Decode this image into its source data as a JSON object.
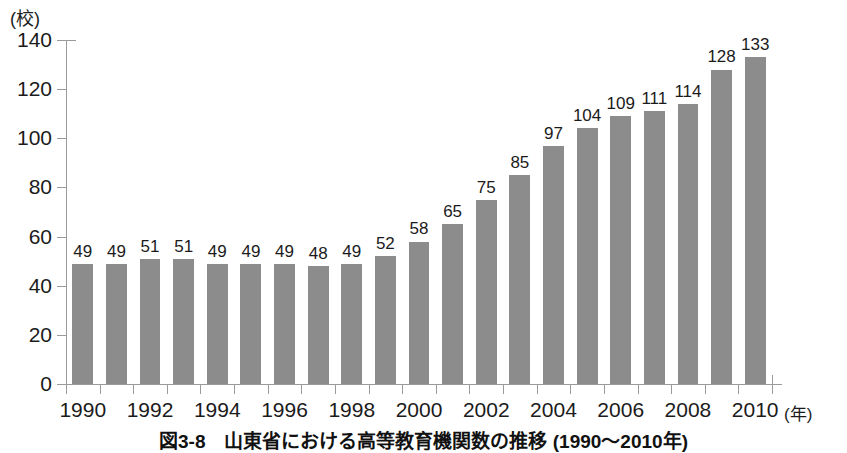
{
  "chart_data": {
    "type": "bar",
    "title": "図3-8　山東省における高等教育機関数の推移 (1990～2010年)",
    "xlabel": "(年)",
    "ylabel": "(校)",
    "ylim": [
      0,
      140
    ],
    "ytick_step": 20,
    "yticks": [
      0,
      20,
      40,
      60,
      80,
      100,
      120,
      140
    ],
    "grid": false,
    "legend": null,
    "bar_color": "#8c8c8c",
    "axis_color": "#9a9a9a",
    "categories": [
      "1990",
      "1991",
      "1992",
      "1993",
      "1994",
      "1995",
      "1996",
      "1997",
      "1998",
      "1999",
      "2000",
      "2001",
      "2002",
      "2003",
      "2004",
      "2005",
      "2006",
      "2007",
      "2008",
      "2009",
      "2010"
    ],
    "xtick_labels": [
      "1990",
      "1992",
      "1994",
      "1996",
      "1998",
      "2000",
      "2002",
      "2004",
      "2006",
      "2008",
      "2010"
    ],
    "values": [
      49,
      49,
      51,
      51,
      49,
      49,
      49,
      48,
      49,
      52,
      58,
      65,
      75,
      85,
      97,
      104,
      109,
      111,
      114,
      128,
      133
    ]
  },
  "caption": {
    "text": "図3-8　山東省における高等教育機関数の推移 (1990～2010年)"
  }
}
